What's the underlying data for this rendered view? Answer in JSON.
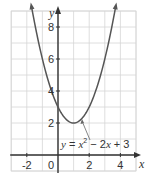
{
  "chart_data": {
    "type": "line",
    "title": "",
    "xlabel": "x",
    "ylabel": "y",
    "xlim": [
      -3,
      5
    ],
    "ylim": [
      -1,
      9
    ],
    "grid": true,
    "x_ticks": [
      -2,
      0,
      2,
      4
    ],
    "x_tick_labels": [
      "-2",
      "0",
      "2",
      "4"
    ],
    "y_ticks": [
      2,
      4,
      6,
      8
    ],
    "y_tick_labels": [
      "2",
      "4",
      "6",
      "8"
    ],
    "series": [
      {
        "name": "y = x^2 - 2x + 3",
        "function": "x^2 - 2x + 3",
        "x": [
          -1.8,
          -1.5,
          -1,
          -0.5,
          0,
          0.5,
          1,
          1.5,
          2,
          2.5,
          3,
          3.5,
          3.8
        ],
        "values": [
          10.84,
          8.25,
          6,
          4.25,
          3,
          2.25,
          2,
          2.25,
          3,
          4.25,
          6,
          8.25,
          10.84
        ],
        "vertex": [
          1,
          2
        ],
        "y_intercept": 3,
        "color": "#555555"
      }
    ],
    "annotations": [
      {
        "text": "y = x² − 2x + 3",
        "points_to": [
          1.5,
          2.25
        ]
      }
    ]
  },
  "labels": {
    "x_axis": "x",
    "y_axis": "y",
    "origin": "0",
    "equation_prefix": "y = x",
    "equation_sup": "2",
    "equation_suffix": " − 2x + 3"
  }
}
